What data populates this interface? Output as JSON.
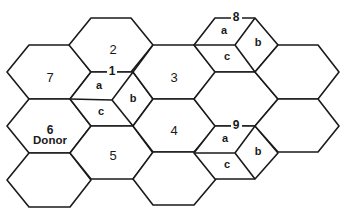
{
  "diagram": {
    "type": "hexagonal-grid",
    "hex_geometry": {
      "vertex_radius": 42,
      "half_edge": 20,
      "half_height": 27
    },
    "hexagons": [
      {
        "id": "7",
        "cx": 49,
        "cy": 72,
        "label": "7"
      },
      {
        "id": "6",
        "cx": 49,
        "cy": 126,
        "label": "6",
        "sublabel": "Donor"
      },
      {
        "id": "bottom-left",
        "cx": 49,
        "cy": 180,
        "label": ""
      },
      {
        "id": "2",
        "cx": 111,
        "cy": 45,
        "label": "2"
      },
      {
        "id": "1",
        "cx": 112,
        "cy": 100,
        "label": "1",
        "subdivided": true
      },
      {
        "id": "5",
        "cx": 112,
        "cy": 153,
        "label": "5"
      },
      {
        "id": "3",
        "cx": 174,
        "cy": 72,
        "label": "3"
      },
      {
        "id": "4",
        "cx": 174,
        "cy": 126,
        "label": "4"
      },
      {
        "id": "bottom-center",
        "cx": 174,
        "cy": 179,
        "label": ""
      },
      {
        "id": "8",
        "cx": 236,
        "cy": 45,
        "label": "8",
        "subdivided": true
      },
      {
        "id": "middle-right",
        "cx": 236,
        "cy": 99,
        "label": ""
      },
      {
        "id": "9",
        "cx": 236,
        "cy": 153,
        "label": "9",
        "subdivided": true
      },
      {
        "id": "top-right",
        "cx": 298,
        "cy": 72,
        "label": ""
      },
      {
        "id": "right",
        "cx": 298,
        "cy": 126,
        "label": ""
      }
    ],
    "subdivision_labels": [
      "a",
      "b",
      "c"
    ],
    "labels": {
      "hex7": "7",
      "hex6": "6",
      "donor": "Donor",
      "hex2": "2",
      "hex1": "1",
      "hex5": "5",
      "hex3": "3",
      "hex4": "4",
      "hex8": "8",
      "hex9": "9",
      "hex1_a": "a",
      "hex1_b": "b",
      "hex1_c": "c",
      "hex8_a": "a",
      "hex8_b": "b",
      "hex8_c": "c",
      "hex9_a": "a",
      "hex9_b": "b",
      "hex9_c": "c"
    }
  }
}
